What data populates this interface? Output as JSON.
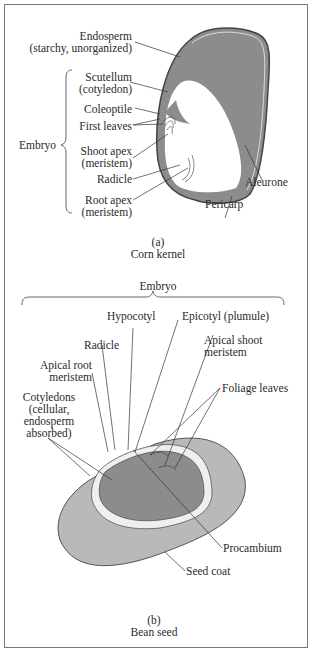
{
  "figure_a": {
    "caption_letter": "(a)",
    "caption_title": "Corn kernel",
    "labels": {
      "endosperm_1": "Endosperm",
      "endosperm_2": "(starchy, unorganized)",
      "scutellum_1": "Scutellum",
      "scutellum_2": "(cotyledon)",
      "coleoptile": "Coleoptile",
      "first_leaves": "First leaves",
      "embryo": "Embryo",
      "shoot_apex_1": "Shoot apex",
      "shoot_apex_2": "(meristem)",
      "radicle": "Radicle",
      "root_apex_1": "Root apex",
      "root_apex_2": "(meristem)",
      "aleurone": "Aleurone",
      "pericarp": "Pericarp"
    }
  },
  "figure_b": {
    "caption_letter": "(b)",
    "caption_title": "Bean seed",
    "labels": {
      "embryo": "Embryo",
      "hypocotyl": "Hypocotyl",
      "epicotyl": "Epicotyl (plumule)",
      "radicle": "Radicle",
      "apical_shoot_1": "Apical shoot",
      "apical_shoot_2": "meristem",
      "apical_root_1": "Apical root",
      "apical_root_2": "meristem",
      "foliage_leaves": "Foliage leaves",
      "cotyledons_1": "Cotyledons",
      "cotyledons_2": "(cellular,",
      "cotyledons_3": "endosperm",
      "cotyledons_4": "absorbed)",
      "procambium": "Procambium",
      "seed_coat": "Seed coat"
    }
  },
  "colors": {
    "dark_fill": "#8c8c8c",
    "light_fill": "#b9b9b9",
    "line": "#3a3a3a"
  }
}
